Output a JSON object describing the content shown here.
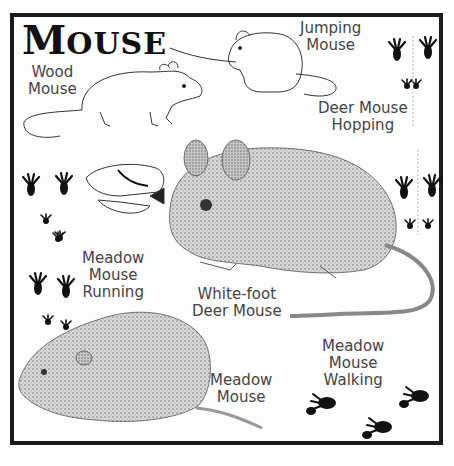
{
  "title": {
    "first_letter": "M",
    "rest": "OUSE"
  },
  "labels": {
    "wood_mouse": [
      "Wood",
      "Mouse"
    ],
    "jumping_mouse": [
      "Jumping",
      "Mouse"
    ],
    "deer_mouse_hopping": [
      "Deer Mouse",
      "Hopping"
    ],
    "meadow_mouse_running": [
      "Meadow",
      "Mouse",
      "Running"
    ],
    "white_foot_deer_mouse": [
      "White-foot",
      "Deer Mouse"
    ],
    "meadow_mouse_walking": [
      "Meadow",
      "Mouse",
      "Walking"
    ],
    "meadow_mouse": [
      "Meadow",
      "Mouse"
    ]
  },
  "illustrations": [
    "wood-mouse-drawing",
    "jumping-mouse-drawing",
    "mouse-skull-drawing",
    "white-foot-deer-mouse-drawing",
    "meadow-mouse-drawing",
    "deer-mouse-hopping-tracks",
    "meadow-mouse-running-tracks",
    "meadow-mouse-walking-tracks"
  ],
  "colors": {
    "border": "#1a1a1a",
    "text": "#444444",
    "track": "#111111",
    "shading": "#8a8a8a"
  }
}
